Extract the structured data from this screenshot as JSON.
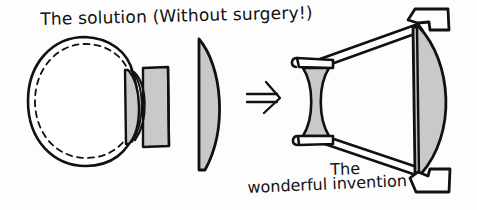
{
  "image": {
    "kind": "hand-drawn-cartoon-diagram",
    "width": 477,
    "height": 210,
    "background_color": "#fdfdfd",
    "ink_color": "#111111",
    "fill_gray": "#c9c9c9"
  },
  "captions": {
    "title": "The solution (Without surgery!)",
    "invention_line1": "The",
    "invention_line2": "wonderful invention"
  },
  "figures": {
    "eye": {
      "label": "eyeball with contact lens",
      "outer_circle": "solid",
      "inner_circle": "dashed",
      "attachment": "gray rectangular holder with plano-convex lens"
    },
    "loose_lens": {
      "label": "plano-convex lens",
      "flat_side": "left",
      "convex_side": "right",
      "fill": "#c9c9c9"
    },
    "arrow": {
      "label": "double-line right arrow",
      "glyph": "⇒"
    },
    "invention": {
      "label": "telescope style optical device",
      "small_lens": "biconcave",
      "large_lens": "plano-convex",
      "struts": 2,
      "brackets": 3
    }
  }
}
